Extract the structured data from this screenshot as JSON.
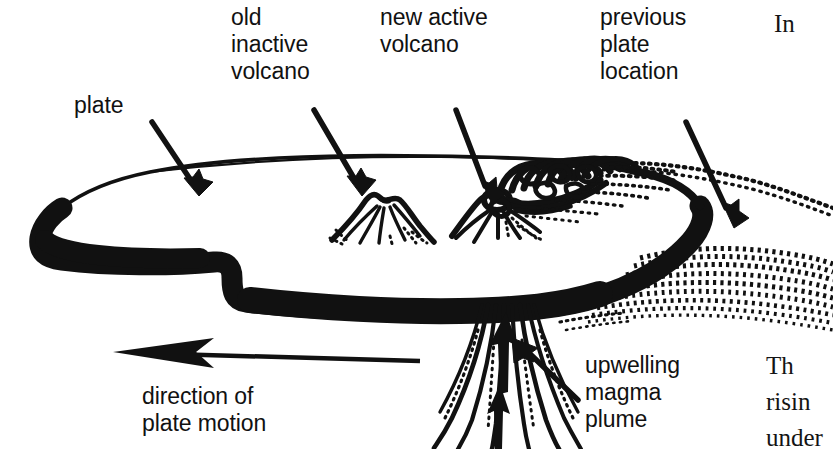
{
  "diagram": {
    "style": "black-and-white pen-and-ink illustration",
    "background_color": "#ffffff",
    "ink_color": "#000000",
    "labels": {
      "plate": "plate",
      "old_inactive_volcano": "old\ninactive\nvolcano",
      "new_active_volcano": "new active\nvolcano",
      "previous_plate_location": "previous\nplate\nlocation",
      "direction_of_plate_motion": "direction of\nplate motion",
      "upwelling_magma_plume": "upwelling\nmagma\nplume"
    },
    "cut_off_body_text": {
      "top_right": "In",
      "bottom_right": "Th\nrisin\nunder"
    },
    "elements": {
      "plate_slab": "tectonic plate drawn in perspective as a flat slab with thin top outline and thick solid black front and left edges",
      "ghost_plate": "stippled dotted outline at right showing previous plate location",
      "old_volcano": "small extinct cone with crater and radiating flank lines",
      "new_volcano": "active cone with billowing curled smoke and ash plume drifting right",
      "magma_plume": "wavy vertical streamers below the plate with two solid upward arrows",
      "motion_arrow": "long horizontal arrow with barbed head pointing left"
    }
  }
}
